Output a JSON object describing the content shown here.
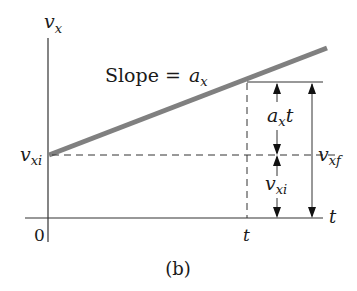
{
  "figure": {
    "caption": "(b)",
    "axes": {
      "y_label": "v",
      "y_label_sub": "x",
      "x_label": "t",
      "origin_label": "0",
      "x_tick_label": "t"
    },
    "line": {
      "slope_text": "Slope = ",
      "slope_symbol": "a",
      "slope_symbol_sub": "x",
      "color": "#808080"
    },
    "intercept_label": {
      "main": "v",
      "sub": "xi"
    },
    "dimensions": {
      "upper_segment": {
        "main": "a",
        "sub": "x",
        "suffix": "t"
      },
      "lower_segment": {
        "main": "v",
        "sub": "xi"
      },
      "total": {
        "main": "v",
        "sub": "xf"
      }
    },
    "colors": {
      "axis": "#333333",
      "thick_line": "#808080",
      "dashed": "#333333",
      "text": "#1a1a1a"
    }
  }
}
